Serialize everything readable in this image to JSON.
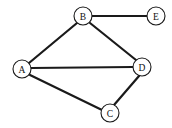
{
  "figure": {
    "background_color": "#ffffff",
    "stroke_color": "#1a1a1a",
    "node_fill_color": "#ffffff",
    "width": 172,
    "height": 128
  },
  "chart_data": {
    "type": "diagram",
    "subtype": "node-link-graph",
    "title": "",
    "directed": false,
    "node_radius": 9,
    "nodes": [
      {
        "id": "A",
        "label": "A",
        "x": 22,
        "y": 69
      },
      {
        "id": "B",
        "label": "B",
        "x": 83,
        "y": 16
      },
      {
        "id": "C",
        "label": "C",
        "x": 110,
        "y": 113
      },
      {
        "id": "D",
        "label": "D",
        "x": 142,
        "y": 67
      },
      {
        "id": "E",
        "label": "E",
        "x": 156,
        "y": 16
      }
    ],
    "edges": [
      {
        "id": "A-B",
        "source": "A",
        "target": "B",
        "x1": 29,
        "y1": 63,
        "x2": 77,
        "y2": 23,
        "width": 2.2
      },
      {
        "id": "B-E",
        "source": "B",
        "target": "E",
        "x1": 92,
        "y1": 16,
        "x2": 147,
        "y2": 16,
        "width": 1.8
      },
      {
        "id": "B-D",
        "source": "B",
        "target": "D",
        "x1": 90,
        "y1": 23,
        "x2": 136,
        "y2": 60,
        "width": 2.2
      },
      {
        "id": "A-D",
        "source": "A",
        "target": "D",
        "x1": 31,
        "y1": 68,
        "x2": 133,
        "y2": 67,
        "width": 2.0
      },
      {
        "id": "A-C",
        "source": "A",
        "target": "C",
        "x1": 30,
        "y1": 75,
        "x2": 102,
        "y2": 110,
        "width": 2.2
      },
      {
        "id": "C-D",
        "source": "C",
        "target": "D",
        "x1": 114,
        "y1": 105,
        "x2": 139,
        "y2": 76,
        "width": 2.2
      }
    ],
    "edge_list_text": [
      "A-B",
      "A-C",
      "A-D",
      "B-D",
      "B-E",
      "C-D"
    ],
    "node_count": 5,
    "edge_count": 6
  }
}
